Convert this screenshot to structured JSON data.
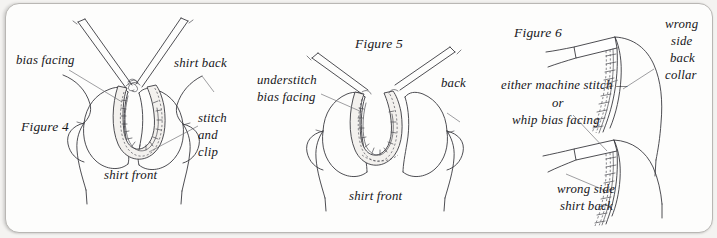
{
  "document": {
    "kind": "sewing-instruction-illustration",
    "page_background": "#f4f3f1",
    "paper_color": "#fdfdfc",
    "ink_color": "#17161a",
    "line_color": "#3a3a40"
  },
  "figures": [
    {
      "id": "figure-4",
      "caption": "Figure 4",
      "labels": {
        "bias_facing": "bias facing",
        "shirt_back": "shirt back",
        "stitch": "stitch",
        "and": "and",
        "clip": "clip",
        "shirt_front": "shirt front"
      }
    },
    {
      "id": "figure-5",
      "caption": "Figure 5",
      "labels": {
        "understitch": "understitch",
        "bias_facing": "bias facing",
        "back": "back",
        "shirt_front": "shirt front"
      }
    },
    {
      "id": "figure-6",
      "caption": "Figure 6",
      "labels": {
        "wrong": "wrong",
        "side": "side",
        "back": "back",
        "collar": "collar",
        "either_machine_stitch": "either machine stitch —",
        "or": "or",
        "whip_bias_facing": "whip bias facing",
        "wrong_side": "wrong side",
        "shirt_back": "shirt back"
      }
    }
  ]
}
